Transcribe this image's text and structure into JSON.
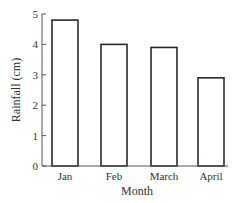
{
  "chart_data": {
    "type": "bar",
    "title": "",
    "xlabel": "Month",
    "ylabel": "Rainfall (cm)",
    "categories": [
      "Jan",
      "Feb",
      "March",
      "April"
    ],
    "values": [
      4.8,
      4.0,
      3.9,
      2.9
    ],
    "ylim": [
      0,
      5
    ],
    "yticks": [
      "0",
      "1",
      "2",
      "3",
      "4",
      "5"
    ],
    "grid": false,
    "legend": null,
    "bar_fill": "#ffffff",
    "bar_stroke": "#2a2a2a"
  }
}
